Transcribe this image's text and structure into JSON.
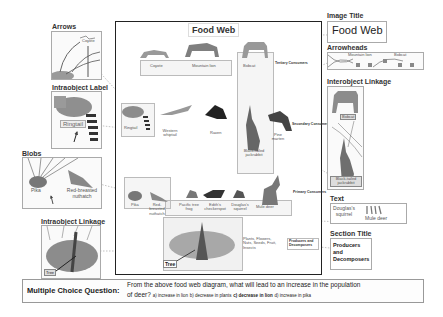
{
  "main_diagram": {
    "title": "Food Web",
    "tiers": {
      "tertiary": "Tertiary Consumers",
      "secondary": "Secondary Consumers",
      "primary": "Primary Consumers",
      "producers": "Producers and Decomposers"
    },
    "tertiary_animals": [
      "Coyote",
      "Mountain lion",
      "Bobcat"
    ],
    "secondary_animals": [
      "Ringtail",
      "Western whiptail",
      "Raven",
      "Black-tailed jackrabbit",
      "Pine marten"
    ],
    "primary_animals": [
      "Pika",
      "Red-breasted nuthatch",
      "Pacific tree frog",
      "Edith's checkerspot",
      "Douglas's squirrel",
      "Mule deer"
    ],
    "producer_label": "Tree",
    "producer_note": "Plants, Flowers, Nuts, Seeds, Fruit, Insects"
  },
  "annotations": {
    "arrows": {
      "label": "Arrows",
      "sample_text": "Coyote"
    },
    "intraobject_label": {
      "label": "Intraobject Label",
      "sample_text": "Ringtail"
    },
    "blobs": {
      "label": "Blobs",
      "sample_texts": [
        "Pika",
        "Red-breasted nuthatch"
      ]
    },
    "intraobject_linkage": {
      "label": "Intraobject Linkage",
      "sample_text": "Tree"
    },
    "image_title": {
      "label": "Image Title",
      "sample_text": "Food Web"
    },
    "arrowheads": {
      "label": "Arrowheads",
      "sample_texts": [
        "Mountain lion",
        "Bobcat"
      ]
    },
    "interobject_linkage": {
      "label": "Interobject Linkage",
      "sample_texts": [
        "Bobcat",
        "Black-tailed jackrabbit"
      ]
    },
    "text": {
      "label": "Text",
      "sample_texts": [
        "Douglas's squirrel",
        "Mule deer"
      ]
    },
    "section_title": {
      "label": "Section Title",
      "sample_text": "Producers and Decomposers"
    }
  },
  "question": {
    "label": "Multiple Choice Question:",
    "text": "From the above food web diagram, what will lead to an increase in the population of deer?",
    "line1": "From the above food web diagram, what will lead to an increase in the population",
    "line2_prefix": "of deer?",
    "options": {
      "a": "a) increase in lion",
      "b": "b) decrease in plants",
      "c": "c) decrease in lion",
      "d": "d) increase in pika"
    },
    "correct": "c"
  },
  "colors": {
    "frame": "#222222",
    "panel_border": "#aaaaaa",
    "animal_gray": "#8a8a8a",
    "dotted_link": "#999999"
  }
}
